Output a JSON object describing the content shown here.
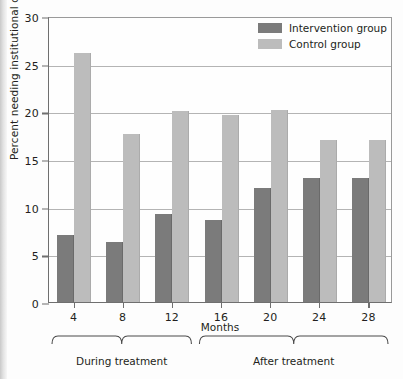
{
  "chart_data": {
    "type": "bar",
    "title": "",
    "xlabel": "Months",
    "ylabel": "Percent needing institutional care",
    "categories": [
      "4",
      "8",
      "12",
      "16",
      "20",
      "24",
      "28"
    ],
    "series": [
      {
        "name": "Intervention group",
        "color": "#7b7b7b",
        "values": [
          7.0,
          6.3,
          9.2,
          8.6,
          12.0,
          13.0,
          13.0
        ]
      },
      {
        "name": "Control group",
        "color": "#bcbcbc",
        "values": [
          26.1,
          17.6,
          20.0,
          19.6,
          20.1,
          17.0,
          17.0
        ]
      }
    ],
    "ylim": [
      0,
      30
    ],
    "yticks": [
      0,
      5,
      10,
      15,
      20,
      25,
      30
    ],
    "ytick_labels": [
      "0",
      "5",
      "10",
      "15",
      "20",
      "25",
      "30"
    ],
    "grid": "horizontal",
    "legend_position": "top-right",
    "annotations": [
      {
        "text": "During treatment",
        "spans": [
          "4",
          "8",
          "12"
        ]
      },
      {
        "text": "After treatment",
        "spans": [
          "16",
          "20",
          "24",
          "28"
        ]
      }
    ]
  },
  "legend": {
    "items": [
      {
        "label": "Intervention group"
      },
      {
        "label": "Control group"
      }
    ]
  }
}
